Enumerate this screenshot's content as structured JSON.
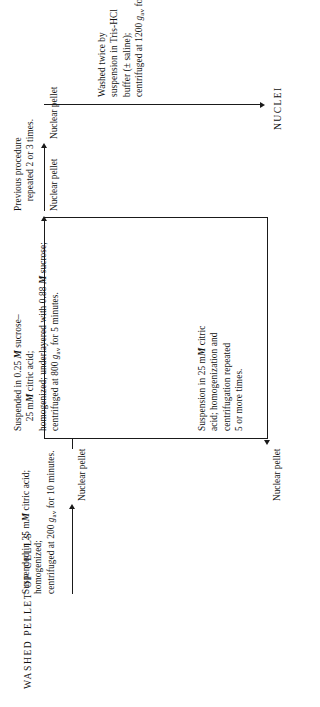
{
  "diagram": {
    "title": "WASHED PELLET OF CELLS",
    "final_product": "NUCLEI",
    "steps": {
      "step1": "Suspended in 25 mM citric acid;\nhomogenized;\ncentrifuged at 200 gₐᵥ for 10 minutes.",
      "step2": "Suspended in 0.25 M sucrose–\n    25 mM citric acid;\nhomogenized; underlayered with 0.88 M sucrose;\ncentrifuged at 800 gₐᵥ for 5 minutes.",
      "step3": "Previous procedure\n    repeated 2 or 3 times.",
      "step4": "Washed twice by\nsuspension in Tris-HCl\nbuffer (± saline);\ncentrifuged at 1200 gₐᵥ for 15 minutes.",
      "step5": "Suspension in 25 mM citric\nacid; homogenization and\ncentrifugation repeated\n5 or more times."
    },
    "intermediates": {
      "pellet1": "Nuclear pellet",
      "pellet2": "Nuclear pellet",
      "pellet3": "Nuclear pellet",
      "pellet4": "Nuclear pellet"
    },
    "colors": {
      "ink": "#111111",
      "line": "#1a1a1a",
      "background": "#ffffff"
    }
  }
}
